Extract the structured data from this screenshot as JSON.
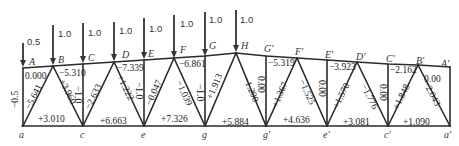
{
  "diagram": {
    "type": "truss-member-forces",
    "loads": [
      {
        "node": "A",
        "value": "0.5"
      },
      {
        "node": "B",
        "value": "1.0"
      },
      {
        "node": "C",
        "value": "1.0"
      },
      {
        "node": "D",
        "value": "1.0"
      },
      {
        "node": "E",
        "value": "1.0"
      },
      {
        "node": "F",
        "value": "1.0"
      },
      {
        "node": "G",
        "value": "1.0"
      },
      {
        "node": "H",
        "value": "1.0"
      }
    ],
    "top_nodes": [
      "A",
      "B",
      "C",
      "D",
      "E",
      "F",
      "G",
      "H",
      "G'",
      "F'",
      "E'",
      "D'",
      "C'",
      "B'",
      "A'"
    ],
    "bottom_nodes": [
      "a",
      "c",
      "e",
      "g",
      "g'",
      "e'",
      "c'",
      "a'"
    ],
    "top_chord_forces": [
      {
        "member": "A-B",
        "value": "0.000"
      },
      {
        "member": "B-C",
        "value": "−5.310"
      },
      {
        "member": "D-E",
        "value": "−7.339"
      },
      {
        "member": "F-G",
        "value": "−6.861"
      },
      {
        "member": "G'-F'",
        "value": "−5.319"
      },
      {
        "member": "E'-D'",
        "value": "−3.923"
      },
      {
        "member": "C'-B'",
        "value": "−2.162"
      },
      {
        "member": "B'-A'",
        "value": "0.00"
      }
    ],
    "bottom_chord_forces": [
      {
        "member": "a-c",
        "value": "+3.010"
      },
      {
        "member": "c-e",
        "value": "+6.663"
      },
      {
        "member": "e-g",
        "value": "+7.326"
      },
      {
        "member": "g-g'",
        "value": "+5.884"
      },
      {
        "member": "g'-e'",
        "value": "+4.636"
      },
      {
        "member": "e'-c'",
        "value": "+3.081"
      },
      {
        "member": "c'-a'",
        "value": "+1.090"
      }
    ],
    "vertical_forces": [
      {
        "member": "A-a",
        "value": "−0.5"
      },
      {
        "member": "C-c",
        "value": "−1.0"
      },
      {
        "member": "E-e",
        "value": "−1.0"
      },
      {
        "member": "G-g",
        "value": "−1.0"
      },
      {
        "member": "G'-g'",
        "value": "0.00"
      },
      {
        "member": "E'-e'",
        "value": "0.00"
      },
      {
        "member": "C'-c'",
        "value": "0.00"
      }
    ],
    "diagonal_forces": [
      {
        "member": "a-B",
        "value": "−5.641"
      },
      {
        "member": "B-c",
        "value": "+3.960"
      },
      {
        "member": "c-D",
        "value": "−2.633"
      },
      {
        "member": "D-e",
        "value": "+1.222"
      },
      {
        "member": "e-F",
        "value": "−0.047"
      },
      {
        "member": "F-g",
        "value": "−1.039"
      },
      {
        "member": "g-H",
        "value": "+1.913"
      },
      {
        "member": "H-g'",
        "value": "−1.200"
      },
      {
        "member": "g'-F'",
        "value": "+1.367"
      },
      {
        "member": "F'-e'",
        "value": "−1.525"
      },
      {
        "member": "e'-D'",
        "value": "+1.570"
      },
      {
        "member": "D'-c'",
        "value": "−1.776"
      },
      {
        "member": "c'-B'",
        "value": "+1.848"
      },
      {
        "member": "B'-a'",
        "value": "−2.043"
      }
    ]
  }
}
